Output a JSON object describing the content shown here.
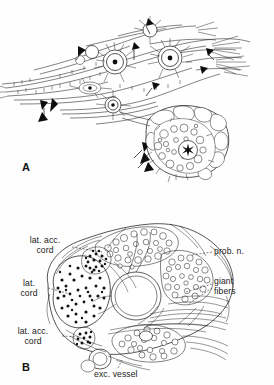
{
  "figure": {
    "type": "scientific-line-drawing",
    "background_color": "#fefefe",
    "ink_color": "#1b1b1b",
    "width_px": 274,
    "height_px": 385
  },
  "panels": [
    {
      "id": "A",
      "letter": "A",
      "description": "Whole-mount view of nerve plexus with neuron cell bodies, fiber tracts, arrowheads marking synaptic contacts, and a nerve bundle cross-section at lower right marked with an asterisk",
      "markers": {
        "asterisk": "*",
        "arrowhead_count": 14,
        "neuron_count": 5
      },
      "labels": []
    },
    {
      "id": "B",
      "letter": "B",
      "description": "Transverse section through the nerve cord showing lateral cords, lateral accessory cords, proboscis nerve, giant fibers and excretory vessel",
      "labels": [
        {
          "key": "lat_acc_cord_upper",
          "text": "lat. acc.\ncord",
          "side": "left",
          "x": 14,
          "y": 236
        },
        {
          "key": "lat_cord",
          "text": "lat.\ncord",
          "side": "left",
          "x": 8,
          "y": 279
        },
        {
          "key": "lat_acc_cord_lower",
          "text": "lat. acc.\ncord",
          "side": "left",
          "x": 2,
          "y": 327
        },
        {
          "key": "prob_n",
          "text": "prob. n.",
          "side": "right",
          "x": 214,
          "y": 247
        },
        {
          "key": "giant_fibers",
          "text": "giant\nfibers",
          "side": "right",
          "x": 214,
          "y": 277
        },
        {
          "key": "exc_vessel",
          "text": "exc. vessel",
          "side": "bottom",
          "x": 94,
          "y": 370
        }
      ]
    }
  ],
  "labels_flat": {
    "lat_acc_cord_upper_line1": "lat. acc.",
    "lat_acc_cord_upper_line2": "cord",
    "lat_cord_line1": "lat.",
    "lat_cord_line2": "cord",
    "lat_acc_cord_lower_line1": "lat. acc.",
    "lat_acc_cord_lower_line2": "cord",
    "prob_n": "prob. n.",
    "giant_line1": "giant",
    "giant_line2": "fibers",
    "exc_vessel": "exc. vessel",
    "panel_a_letter": "A",
    "panel_b_letter": "B"
  }
}
